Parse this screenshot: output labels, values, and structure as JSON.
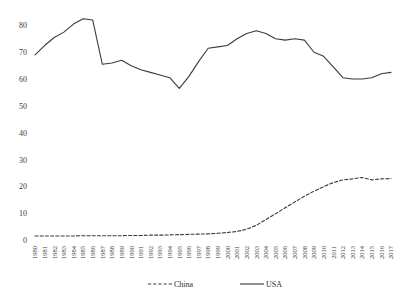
{
  "chart_data": {
    "type": "line",
    "title": "",
    "subtitle": "",
    "xlabel": "",
    "ylabel": "",
    "ylim": [
      0,
      85
    ],
    "yticks": [
      0,
      10,
      20,
      30,
      40,
      50,
      60,
      70,
      80
    ],
    "grid": false,
    "legend_position": "bottom",
    "x": [
      "1980",
      "1981",
      "1982",
      "1983",
      "1984",
      "1985",
      "1986",
      "1987",
      "1988",
      "1989",
      "1990",
      "1991",
      "1992",
      "1993",
      "1994",
      "1995",
      "1996",
      "1997",
      "1998",
      "1999",
      "2000",
      "2001",
      "2002",
      "2003",
      "2004",
      "2005",
      "2006",
      "2007",
      "2008",
      "2009",
      "2010",
      "2011",
      "2012",
      "2013",
      "2014",
      "2015",
      "2016",
      "2017"
    ],
    "series": [
      {
        "name": "China",
        "style": "dashed",
        "color": "#3b3b3b",
        "values": [
          1.5,
          1.5,
          1.5,
          1.5,
          1.5,
          1.6,
          1.6,
          1.6,
          1.6,
          1.6,
          1.7,
          1.7,
          1.8,
          1.8,
          1.9,
          2.0,
          2.1,
          2.2,
          2.3,
          2.5,
          2.8,
          3.2,
          4.0,
          5.5,
          7.6,
          9.8,
          12.0,
          14.2,
          16.3,
          18.2,
          19.9,
          21.4,
          22.4,
          22.8,
          23.3,
          22.4,
          22.8,
          22.9
        ]
      },
      {
        "name": "USA",
        "style": "solid",
        "color": "#3b3b3b",
        "values": [
          69.0,
          72.5,
          75.5,
          77.5,
          80.5,
          82.5,
          82.0,
          65.5,
          66.0,
          67.0,
          65.0,
          63.5,
          62.5,
          61.5,
          60.5,
          56.5,
          61.0,
          66.5,
          71.5,
          72.0,
          72.5,
          75.0,
          77.0,
          78.0,
          77.0,
          75.0,
          74.5,
          75.0,
          74.5,
          70.0,
          68.5,
          64.5,
          60.5,
          60.0,
          60.0,
          60.5,
          62.0,
          62.5
        ]
      }
    ],
    "legend": [
      {
        "label": "China",
        "style": "dashed"
      },
      {
        "label": "USA",
        "style": "solid"
      }
    ]
  }
}
